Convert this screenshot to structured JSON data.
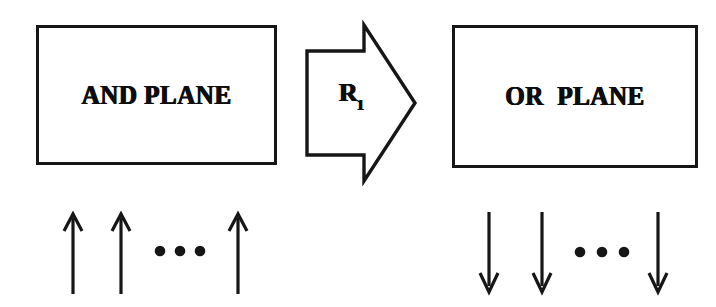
{
  "diagram": {
    "background_color": "#ffffff",
    "ink_color": "#161616",
    "blocks": [
      {
        "id": "and-plane",
        "label": "AND PLANE",
        "shape": "rectangle",
        "x": 36,
        "y": 25,
        "width": 241,
        "height": 140
      },
      {
        "id": "or-plane",
        "label": "OR  PLANE",
        "shape": "rectangle",
        "x": 452,
        "y": 25,
        "width": 246,
        "height": 143
      }
    ],
    "transition": {
      "id": "transition-arrow",
      "shape": "block-arrow-right",
      "label_base": "R",
      "label_subscript": "1",
      "label_full": "R1",
      "x": 302,
      "y": 20,
      "width": 118,
      "height": 166
    },
    "input_bundle": {
      "id": "and-inputs",
      "direction": "up",
      "arrow_count": 3,
      "ellipsis_dots": 3,
      "arrow_positions_x": [
        17,
        65,
        182
      ],
      "dot_positions_x": [
        104,
        124,
        144
      ],
      "label": "AND plane input lines"
    },
    "output_bundle": {
      "id": "or-outputs",
      "direction": "down",
      "arrow_count": 3,
      "ellipsis_dots": 3,
      "arrow_positions_x": [
        15,
        68,
        184
      ],
      "dot_positions_x": [
        106,
        128,
        150
      ],
      "label": "OR plane output lines"
    }
  }
}
